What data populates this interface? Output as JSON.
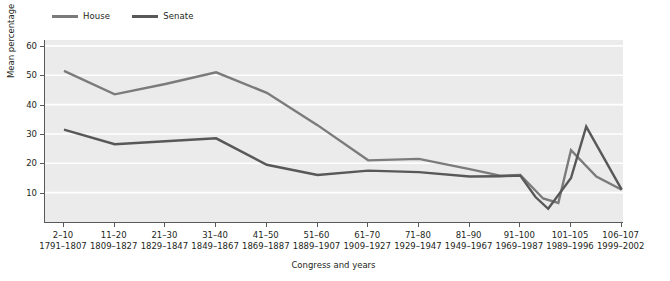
{
  "chart_data": {
    "type": "line",
    "title": "",
    "xlabel": "Congress and years",
    "ylabel": "Mean percentage",
    "categories": [
      "2–10",
      "11–20",
      "21–30",
      "31–40",
      "41–50",
      "51–60",
      "61–70",
      "71–80",
      "81–90",
      "91–100",
      "101–105",
      "106–107"
    ],
    "category_sublabels": [
      "1791–1807",
      "1809–1827",
      "1829–1847",
      "1849–1867",
      "1869–1887",
      "1889–1907",
      "1909–1927",
      "1929–1947",
      "1949–1967",
      "1969–1987",
      "1989–1996",
      "1999–2002"
    ],
    "series": [
      {
        "name": "House",
        "color": "#7b7b7b",
        "values": [
          51.5,
          43.5,
          47.0,
          51.0,
          44.0,
          33.0,
          21.0,
          21.5,
          18.0,
          16.0,
          14.5,
          11.0
        ]
      },
      {
        "name": "Senate",
        "color": "#585858",
        "values": [
          31.5,
          26.5,
          27.5,
          28.5,
          19.5,
          16.0,
          17.5,
          17.0,
          15.5,
          15.0,
          32.5,
          11.0
        ]
      }
    ],
    "ylim": [
      0,
      62
    ],
    "yticks": [
      10,
      20,
      30,
      40,
      50,
      60
    ],
    "ytick_labels": [
      "10",
      "20",
      "30",
      "40",
      "50",
      "60"
    ],
    "grid": "horizontal",
    "legend_position": "top-left",
    "plot_background": "#ebebeb",
    "gridline_color": "#ffffff",
    "axis_color": "#58595b",
    "annotations": [
      {
        "note": "Series lines dip near 91–100 / 101–105 with extra inflection points"
      }
    ],
    "extra_points": {
      "house_detail_x": [
        0,
        1,
        2,
        3,
        4,
        5,
        6,
        7,
        8,
        8.6,
        9,
        9.45,
        9.75,
        10,
        10.5,
        11
      ],
      "house_detail_y": [
        51.5,
        43.5,
        47.0,
        51.0,
        44.0,
        33.0,
        21.0,
        21.5,
        18.0,
        15.8,
        16.0,
        8.0,
        6.5,
        24.5,
        15.5,
        11.0
      ],
      "senate_detail_x": [
        0,
        1,
        2,
        3,
        4,
        5,
        6,
        7,
        8,
        8.6,
        9,
        9.3,
        9.55,
        10,
        10.3,
        11
      ],
      "senate_detail_y": [
        31.5,
        26.5,
        27.5,
        28.5,
        19.5,
        16.0,
        17.5,
        17.0,
        15.5,
        15.6,
        15.8,
        8.5,
        4.5,
        15.0,
        32.5,
        11.0
      ]
    }
  },
  "legend": {
    "items": [
      {
        "label": "House",
        "color": "#7b7b7b"
      },
      {
        "label": "Senate",
        "color": "#585858"
      }
    ]
  },
  "axes": {
    "y_title": "Mean percentage",
    "x_title": "Congress and years"
  }
}
